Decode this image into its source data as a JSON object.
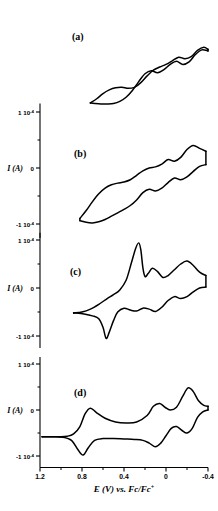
{
  "figure": {
    "name": "cyclic-voltammogram-series",
    "width": 218,
    "height": 511,
    "line_color": "#000000",
    "background": "#ffffff"
  },
  "axes": {
    "x_label": "E (V) vs. Fc/Fc",
    "x_label_sup": "+",
    "x_ticks": [
      "1.2",
      "0.8",
      "0.4",
      "0",
      "-0.4"
    ],
    "x_tick_values": [
      1.2,
      0.8,
      0.4,
      0,
      -0.4
    ],
    "x_range": [
      1.2,
      -0.4
    ],
    "x_reversed": true,
    "y_label": "I (A)",
    "y_ticks": [
      "1 10",
      "0",
      "-1 10"
    ],
    "y_tick_sup": "-4",
    "y_tick_values": [
      0.0001,
      0,
      -0.0001
    ],
    "y_range": [
      -0.0001,
      0.0001
    ],
    "grid": false
  },
  "panels": [
    {
      "id": "a",
      "label": "(a)",
      "has_axes": false
    },
    {
      "id": "b",
      "label": "(b)",
      "has_axes": true
    },
    {
      "id": "c",
      "label": "(c)",
      "has_axes": true
    },
    {
      "id": "d",
      "label": "(d)",
      "has_axes": true
    }
  ],
  "chart_data": [
    {
      "type": "line",
      "title": "(a)",
      "xlabel": "E (V) vs. Fc/Fc+",
      "ylabel": "I (A)",
      "xlim": [
        1.2,
        -0.4
      ],
      "ylim": [
        -0.0001,
        0.0001
      ],
      "grid": false,
      "note": "cyclic voltammogram, no axis frame drawn, three redox waves, sloping baseline",
      "series": [
        {
          "name": "anodic-forward-scan",
          "x": [
            0.72,
            0.66,
            0.6,
            0.54,
            0.48,
            0.42,
            0.36,
            0.3,
            0.24,
            0.18,
            0.12,
            0.06,
            0.0,
            -0.06,
            -0.12,
            -0.18,
            -0.24,
            -0.3,
            -0.36,
            -0.4
          ],
          "y": [
            -7.1e-05,
            -6.3e-05,
            -5.3e-05,
            -4.6e-05,
            -4.2e-05,
            -4.1e-05,
            -4.3e-05,
            -4.1e-05,
            -3.2e-05,
            -1.9e-05,
            -8e-06,
            -2e-06,
            3e-06,
            1e-05,
            1.7e-05,
            1.4e-05,
            1.8e-05,
            3e-05,
            3.6e-05,
            3.2e-05
          ]
        },
        {
          "name": "cathodic-return-scan",
          "x": [
            -0.4,
            -0.34,
            -0.28,
            -0.22,
            -0.16,
            -0.1,
            -0.04,
            0.02,
            0.08,
            0.14,
            0.2,
            0.26,
            0.32,
            0.38,
            0.44,
            0.5,
            0.56,
            0.62,
            0.68,
            0.72
          ],
          "y": [
            2.9e-05,
            3.1e-05,
            2.2e-05,
            8e-06,
            3e-06,
            9e-06,
            3e-06,
            -7e-06,
            -1.3e-05,
            -9e-06,
            -1.5e-05,
            -3e-05,
            -4.7e-05,
            -6e-05,
            -6.8e-05,
            -7.2e-05,
            -7.3e-05,
            -7.3e-05,
            -7.2e-05,
            -7.1e-05
          ]
        }
      ]
    },
    {
      "type": "line",
      "title": "(b)",
      "xlabel": "E (V) vs. Fc/Fc+",
      "ylabel": "I (A)",
      "xlim": [
        1.2,
        -0.4
      ],
      "ylim": [
        -0.0001,
        0.0001
      ],
      "grid": false,
      "note": "three broad quasi-reversible waves on a rising baseline",
      "series": [
        {
          "name": "anodic-forward-scan",
          "x": [
            0.82,
            0.76,
            0.7,
            0.64,
            0.58,
            0.52,
            0.46,
            0.4,
            0.34,
            0.28,
            0.22,
            0.16,
            0.1,
            0.04,
            -0.02,
            -0.08,
            -0.14,
            -0.2,
            -0.26,
            -0.32,
            -0.38
          ],
          "y": [
            -9e-05,
            -7.6e-05,
            -6e-05,
            -4.6e-05,
            -3.6e-05,
            -3e-05,
            -2.7e-05,
            -2.5e-05,
            -2.1e-05,
            -1.3e-05,
            -5e-06,
            0.0,
            2e-06,
            7e-06,
            1.5e-05,
            1.2e-05,
            1.9e-05,
            3.3e-05,
            4e-05,
            3.5e-05,
            3e-05
          ]
        },
        {
          "name": "cathodic-return-scan",
          "x": [
            -0.38,
            -0.32,
            -0.26,
            -0.2,
            -0.14,
            -0.08,
            -0.02,
            0.04,
            0.1,
            0.16,
            0.22,
            0.28,
            0.34,
            0.4,
            0.46,
            0.52,
            0.58,
            0.64,
            0.7,
            0.76,
            0.82
          ],
          "y": [
            6e-06,
            3e-06,
            -6e-06,
            -1.6e-05,
            -2.1e-05,
            -1.8e-05,
            -2.6e-05,
            -3.6e-05,
            -4.1e-05,
            -3.8e-05,
            -4.4e-05,
            -5.7e-05,
            -6.7e-05,
            -7.4e-05,
            -8e-05,
            -8.6e-05,
            -9.2e-05,
            -9.6e-05,
            -9.8e-05,
            -9.7e-05,
            -9.4e-05
          ]
        }
      ]
    },
    {
      "type": "line",
      "title": "(c)",
      "xlabel": "E (V) vs. Fc/Fc+",
      "ylabel": "I (A)",
      "xlim": [
        1.2,
        -0.4
      ],
      "ylim": [
        -0.0001,
        0.0001
      ],
      "grid": false,
      "note": "sharp stripping-type anodic peak near 0.25 V plus two broader waves; sharp cathodic spike near 0.55 V",
      "series": [
        {
          "name": "anodic-forward-scan",
          "x": [
            0.88,
            0.8,
            0.72,
            0.64,
            0.56,
            0.5,
            0.44,
            0.38,
            0.33,
            0.29,
            0.26,
            0.24,
            0.22,
            0.2,
            0.17,
            0.13,
            0.08,
            0.03,
            -0.02,
            -0.08,
            -0.14,
            -0.2,
            -0.26,
            -0.32,
            -0.38
          ],
          "y": [
            -5.2e-05,
            -5e-05,
            -4.4e-05,
            -3.4e-05,
            -2.2e-05,
            -1.4e-05,
            -4e-06,
            1.6e-05,
            5.2e-05,
            8.2e-05,
            9.4e-05,
            8e-05,
            4.2e-05,
            2.4e-05,
            3e-05,
            4.1e-05,
            3.4e-05,
            2.2e-05,
            2.6e-05,
            3.8e-05,
            5e-05,
            5.6e-05,
            4.7e-05,
            3.3e-05,
            2.6e-05
          ]
        },
        {
          "name": "cathodic-return-scan",
          "x": [
            -0.38,
            -0.32,
            -0.26,
            -0.2,
            -0.14,
            -0.08,
            -0.02,
            0.04,
            0.1,
            0.16,
            0.22,
            0.28,
            0.34,
            0.4,
            0.46,
            0.5,
            0.54,
            0.57,
            0.6,
            0.64,
            0.7,
            0.78,
            0.86,
            0.88
          ],
          "y": [
            2e-06,
            0.0,
            -8e-06,
            -1.8e-05,
            -2.2e-05,
            -1.8e-05,
            -2.6e-05,
            -4e-05,
            -4.9e-05,
            -4.4e-05,
            -4.2e-05,
            -4.8e-05,
            -4.6e-05,
            -4.2e-05,
            -5e-05,
            -6.8e-05,
            -9.2e-05,
            -0.000105,
            -8.2e-05,
            -6.4e-05,
            -5.8e-05,
            -5.4e-05,
            -5.2e-05,
            -5.2e-05
          ]
        }
      ]
    },
    {
      "type": "line",
      "title": "(d)",
      "xlabel": "E (V) vs. Fc/Fc+",
      "ylabel": "I (A)",
      "xlim": [
        1.2,
        -0.4
      ],
      "ylim": [
        -0.0001,
        0.0001
      ],
      "grid": false,
      "note": "three well-resolved reversible redox couples; flat baseline at positive potential",
      "series": [
        {
          "name": "anodic-forward-scan",
          "x": [
            1.18,
            1.1,
            1.02,
            0.94,
            0.88,
            0.82,
            0.77,
            0.72,
            0.66,
            0.58,
            0.48,
            0.38,
            0.28,
            0.18,
            0.12,
            0.06,
            0.01,
            -0.04,
            -0.1,
            -0.16,
            -0.21,
            -0.26,
            -0.31,
            -0.36,
            -0.4
          ],
          "y": [
            -5.8e-05,
            -5.8e-05,
            -5.8e-05,
            -5.7e-05,
            -5.2e-05,
            -3.6e-05,
            -8e-06,
            4e-06,
            -6e-06,
            -1.8e-05,
            -2.6e-05,
            -2.8e-05,
            -2.6e-05,
            -1.2e-05,
            8e-06,
            1.4e-05,
            6e-06,
            0.0,
            6e-06,
            3e-05,
            4.8e-05,
            4e-05,
            2e-05,
            1e-05,
            8e-06
          ]
        },
        {
          "name": "cathodic-return-scan",
          "x": [
            -0.4,
            -0.35,
            -0.3,
            -0.25,
            -0.2,
            -0.15,
            -0.1,
            -0.05,
            0.0,
            0.05,
            0.1,
            0.16,
            0.22,
            0.3,
            0.4,
            0.5,
            0.6,
            0.68,
            0.74,
            0.79,
            0.84,
            0.9,
            0.98,
            1.08,
            1.18
          ],
          "y": [
            0.0,
            -4e-06,
            -1.6e-05,
            -4e-05,
            -5e-05,
            -4.4e-05,
            -3.6e-05,
            -4e-05,
            -5.6e-05,
            -7.2e-05,
            -8e-05,
            -7.2e-05,
            -6.6e-05,
            -6.4e-05,
            -6.3e-05,
            -6.2e-05,
            -6.2e-05,
            -6.6e-05,
            -8.2e-05,
            -9.8e-05,
            -8.6e-05,
            -6.6e-05,
            -5.9e-05,
            -5.8e-05,
            -5.8e-05
          ]
        }
      ]
    }
  ]
}
